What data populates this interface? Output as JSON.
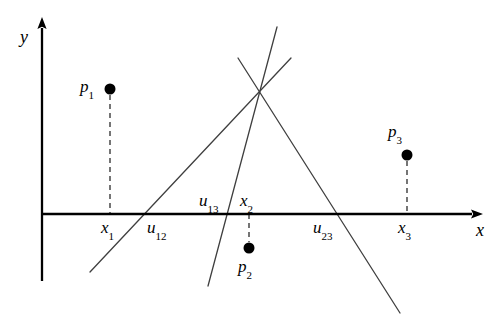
{
  "figure": {
    "type": "geometric-diagram",
    "background_color": "#ffffff",
    "stroke_color": "#3a3a3a",
    "axis_color": "#000000"
  },
  "axes": {
    "x_label": "x",
    "y_label": "y",
    "x_axis": {
      "x1": 42,
      "y1": 214,
      "x2": 472,
      "y2": 214
    },
    "y_axis": {
      "x1": 42,
      "y1": 281,
      "x2": 42,
      "y2": 28
    },
    "x_label_pos": {
      "x": 476,
      "y": 221
    },
    "y_label_pos": {
      "x": 20,
      "y": 28
    }
  },
  "points": [
    {
      "name": "p1",
      "label": "p",
      "sub": "1",
      "cx": 110,
      "cy": 89,
      "r": 5.5,
      "label_x": 80,
      "label_y": 78,
      "drop_line": {
        "x": 110,
        "y1": 95,
        "y2": 214
      },
      "foot_label": "x",
      "foot_sub": "1",
      "foot_x": 101,
      "foot_y": 219
    },
    {
      "name": "p2",
      "label": "p",
      "sub": "2",
      "cx": 249,
      "cy": 248,
      "r": 5.5,
      "label_x": 238,
      "label_y": 258,
      "drop_line": {
        "x": 249,
        "y1": 214,
        "y2": 242
      },
      "foot_label": "x",
      "foot_sub": "2",
      "foot_x": 240,
      "foot_y": 192
    },
    {
      "name": "p3",
      "label": "p",
      "sub": "3",
      "cx": 407,
      "cy": 155,
      "r": 5.5,
      "label_x": 388,
      "label_y": 123,
      "drop_line": {
        "x": 407,
        "y1": 161,
        "y2": 214
      },
      "foot_label": "x",
      "foot_sub": "3",
      "foot_x": 398,
      "foot_y": 219
    }
  ],
  "dual_lines": [
    {
      "name": "line-12",
      "note": "line through dual of p1 and p2 (steep, up-right)",
      "x1": 208,
      "y1": 286,
      "x2": 277,
      "y2": 27
    },
    {
      "name": "line-13",
      "note": "line through dual of p1 and p3 (shallow, up-right)",
      "x1": 90,
      "y1": 272,
      "x2": 291,
      "y2": 58
    },
    {
      "name": "line-23",
      "note": "line through dual of p2 and p3 (descending to the right)",
      "x1": 238,
      "y1": 58,
      "x2": 400,
      "y2": 313
    }
  ],
  "intersections": [
    {
      "name": "u12",
      "label": "u",
      "sub": "12",
      "axis_x": 147,
      "label_x": 147,
      "label_y": 219,
      "side": "below"
    },
    {
      "name": "u13",
      "label": "u",
      "sub": "13",
      "axis_x": 213,
      "label_x": 199,
      "label_y": 192,
      "side": "above"
    },
    {
      "name": "u23",
      "label": "u",
      "sub": "23",
      "axis_x": 340,
      "label_x": 313,
      "label_y": 219,
      "side": "below"
    }
  ],
  "common_intersection": {
    "x": 260,
    "y": 90
  }
}
